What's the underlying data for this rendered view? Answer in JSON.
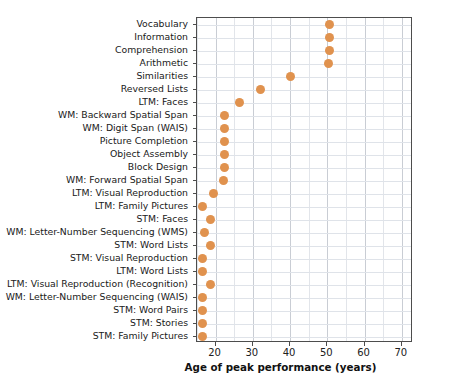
{
  "chart_data": {
    "type": "scatter",
    "title": "",
    "xlabel": "Age of peak performance (years)",
    "ylabel": "",
    "xlim": [
      15,
      73
    ],
    "ylim_categories_order": "top-to-bottom",
    "xticks": [
      20,
      30,
      40,
      50,
      60,
      70
    ],
    "grid": true,
    "legend": "none",
    "marker_color": "#e0924e",
    "categories": [
      "Vocabulary",
      "Information",
      "Comprehension",
      "Arithmetic",
      "Similarities",
      "Reversed Lists",
      "LTM: Faces",
      "WM: Backward Spatial Span",
      "WM: Digit Span (WAIS)",
      "Picture Completion",
      "Object Assembly",
      "Block Design",
      "WM: Forward Spatial Span",
      "LTM: Visual Reproduction",
      "LTM: Family Pictures",
      "STM: Faces",
      "WM: Letter-Number Sequencing (WMS)",
      "STM: Word Lists",
      "STM: Visual Reproduction",
      "LTM: Word Lists",
      "LTM: Visual Reproduction (Recognition)",
      "WM: Letter-Number Sequencing (WAIS)",
      "STM: Word Pairs",
      "STM: Stories",
      "STM: Family Pictures"
    ],
    "values": [
      50.5,
      50.5,
      50.5,
      50.3,
      40.0,
      32.0,
      26.5,
      22.5,
      22.5,
      22.5,
      22.5,
      22.5,
      22.0,
      19.5,
      16.5,
      18.5,
      17.0,
      18.5,
      16.5,
      16.5,
      18.5,
      16.5,
      16.5,
      16.5,
      16.5
    ]
  },
  "axis": {
    "x_tick_labels": [
      "20",
      "30",
      "40",
      "50",
      "60",
      "70"
    ],
    "x_title": "Age of peak performance (years)"
  }
}
